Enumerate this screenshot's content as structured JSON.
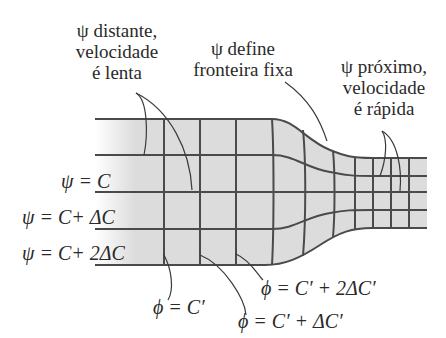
{
  "annotations": {
    "psi_far": {
      "line1": "ψ distante,",
      "line2": "velocidade",
      "line3": "é lenta"
    },
    "psi_boundary": {
      "line1": "ψ define",
      "line2": "fronteira fixa"
    },
    "psi_near": {
      "line1": "ψ próximo,",
      "line2": "velocidade",
      "line3": "é rápida"
    }
  },
  "streamlines": {
    "psi_c": "ψ = C",
    "psi_c_dc": "ψ = C+ ΔC",
    "psi_c_2dc": "ψ = C+ 2ΔC"
  },
  "potential_lines": {
    "phi_c": "ϕ = C′",
    "phi_c_dc": "ϕ = C′ + ΔC′",
    "phi_c_2dc": "ϕ = C′ + 2ΔC′"
  },
  "colors": {
    "grid_line": "#4a4a4a",
    "fill": "#d9d9d9",
    "text": "#2a2a2a"
  }
}
